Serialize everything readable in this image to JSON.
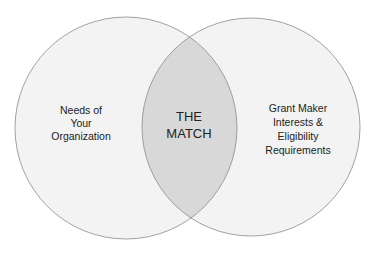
{
  "diagram": {
    "type": "venn",
    "left_circle": {
      "label_lines": [
        "Needs of",
        "Your",
        "Organization"
      ]
    },
    "right_circle": {
      "label_lines": [
        "Grant Maker",
        "Interests &",
        "Eligibility",
        "Requirements"
      ]
    },
    "intersection": {
      "label_lines": [
        "THE",
        "MATCH"
      ]
    },
    "colors": {
      "circle_fill": "#f3f3f3",
      "circle_stroke": "#8a8a8a",
      "overlap_fill": "#d8d8d8",
      "text": "#222222"
    }
  }
}
